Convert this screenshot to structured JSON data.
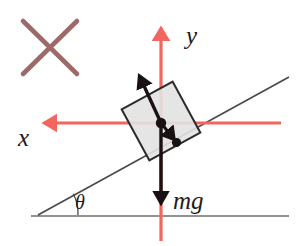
{
  "figure": {
    "type": "free-body-diagram",
    "background_color": "#ffffff"
  },
  "colors": {
    "axis_red": "#f4655f",
    "vector_black": "#1a1212",
    "incline_gray": "#4a4a4a",
    "ground_gray": "#6e6e6e",
    "block_fill": "#e2e2e2",
    "block_stroke": "#2b2b2b",
    "cross_mauve": "#9d6a68",
    "label_color": "#1c1c1c"
  },
  "labels": {
    "y_axis": "y",
    "x_axis": "x",
    "weight": "mg",
    "angle": "θ"
  },
  "icons": {
    "cross": "cross-mark-icon",
    "y_axis_arrow": "arrow-up-icon",
    "x_axis_arrow": "arrow-left-icon",
    "weight_arrow": "arrow-down-icon",
    "normal_arrow": "arrow-up-left-icon",
    "reaction_arrow": "arrow-down-right-icon"
  },
  "geometry": {
    "cross": {
      "x1": 23,
      "y1": 21,
      "x2": 77,
      "y2": 74,
      "x3": 77,
      "y3": 21,
      "x4": 23,
      "y4": 74,
      "stroke_width": 4.5
    },
    "y_axis": {
      "x": 161,
      "top": 22,
      "bottom": 241,
      "stroke_width": 3.2
    },
    "x_axis": {
      "y": 123,
      "left": 38,
      "right": 281,
      "stroke_width": 3.2
    },
    "incline": {
      "x1": 38,
      "y1": 215,
      "x2": 289,
      "y2": 77,
      "stroke_width": 1.6
    },
    "ground": {
      "x1": 31,
      "y1": 216,
      "x2": 289,
      "y2": 216,
      "stroke_width": 1.6
    },
    "angle_arc": {
      "cx": 38,
      "cy": 215,
      "radius": 38
    },
    "block": {
      "cx": 161,
      "cy": 121,
      "size": 58,
      "rotation_deg": -28.5
    },
    "center_dot": {
      "cx": 161,
      "cy": 123,
      "r": 5
    },
    "second_dot": {
      "cx": 176,
      "cy": 142,
      "r": 4.5
    },
    "normal_vector": {
      "x1": 161,
      "y1": 123,
      "x2": 138,
      "y2": 73
    },
    "reaction_vector": {
      "x1": 161,
      "y1": 123,
      "x2": 177,
      "y2": 143
    },
    "weight_vector": {
      "x1": 161,
      "y1": 123,
      "x2": 161,
      "y2": 211
    }
  },
  "label_positions": {
    "y": {
      "x": 186,
      "y": 44,
      "size": 25
    },
    "x": {
      "x": 18,
      "y": 146,
      "size": 25
    },
    "mg": {
      "x": 173,
      "y": 209,
      "size": 25
    },
    "theta": {
      "x": 75,
      "y": 208,
      "size": 19
    }
  }
}
